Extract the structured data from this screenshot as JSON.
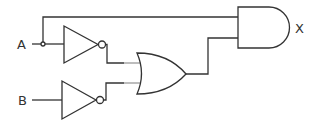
{
  "diagram": {
    "type": "logic-circuit",
    "inputs": [
      {
        "id": "A",
        "label": "A"
      },
      {
        "id": "B",
        "label": "B"
      }
    ],
    "outputs": [
      {
        "id": "X",
        "label": "X"
      }
    ],
    "gates": [
      {
        "id": "not1",
        "type": "NOT",
        "input": "A"
      },
      {
        "id": "not2",
        "type": "NOT",
        "input": "B"
      },
      {
        "id": "or1",
        "type": "OR",
        "inputs": [
          "not1",
          "not2"
        ]
      },
      {
        "id": "and1",
        "type": "AND",
        "inputs": [
          "A",
          "or1"
        ],
        "output": "X"
      }
    ],
    "colors": {
      "stroke": "#333333",
      "wire_near_or": "#999999",
      "background": "#ffffff"
    }
  }
}
